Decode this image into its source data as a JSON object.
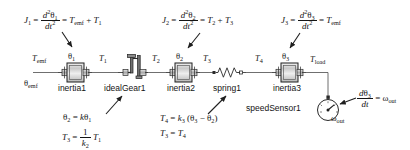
{
  "diagram": {
    "colors": {
      "line": "#3a3a3a",
      "text": "#141414",
      "body_fill": "#d9d9d9",
      "body_stroke": "#1f1f1f",
      "highlight": "#ffffff"
    },
    "equations": [
      {
        "id": "eq-j1",
        "lhs": "J",
        "lhs_sub": "1",
        "num": "d",
        "num_sup": "2",
        "num_var": "θ",
        "num_var_sub": "1",
        "den": "dt",
        "den_sup": "2",
        "rhs": "T",
        "rhs_sub": "emf",
        "rhs2": "T",
        "rhs2_sub": "1",
        "op": "+"
      },
      {
        "id": "eq-j2",
        "lhs": "J",
        "lhs_sub": "2",
        "num": "d",
        "num_sup": "2",
        "num_var": "θ",
        "num_var_sub": "2",
        "den": "dt",
        "den_sup": "2",
        "rhs": "T",
        "rhs_sub": "2",
        "rhs2": "T",
        "rhs2_sub": "3",
        "op": "+"
      },
      {
        "id": "eq-j3",
        "lhs": "J",
        "lhs_sub": "3",
        "num": "d",
        "num_sup": "2",
        "num_var": "θ",
        "num_var_sub": "3",
        "den": "dt",
        "den_sup": "2",
        "rhs": "T",
        "rhs_sub": "emf",
        "rhs2": "",
        "rhs2_sub": "",
        "op": ""
      }
    ],
    "gear_equations": {
      "line1_lhs": "θ",
      "line1_lhs_sub": "2",
      "line1_rhs_k": "k",
      "line1_rhs_var": "θ",
      "line1_rhs_sub": "1",
      "line2_lhs": "T",
      "line2_lhs_sub": "3",
      "line2_num": "1",
      "line2_den": "k",
      "line2_den_sub": "2",
      "line2_rhs": "T",
      "line2_rhs_sub": "1"
    },
    "spring_equations": {
      "line1_lhs": "T",
      "line1_lhs_sub": "4",
      "line1_k": "k",
      "line1_k_sub": "3",
      "line1_a": "θ",
      "line1_a_sub": "3",
      "line1_minus": "−",
      "line1_b": "θ",
      "line1_b_sub": "2",
      "line2_lhs": "T",
      "line2_lhs_sub": "3",
      "line2_rhs": "T",
      "line2_rhs_sub": "4"
    },
    "sensor_equation": {
      "num_d": "d",
      "num_var": "θ",
      "num_var_sub": "3",
      "den": "dt",
      "rhs": "ω",
      "rhs_sub": "out"
    },
    "components": [
      {
        "id": "inertia1",
        "label": "inertia1",
        "type": "inertia"
      },
      {
        "id": "idealGear1",
        "label": "idealGear1",
        "type": "gear"
      },
      {
        "id": "inertia2",
        "label": "inertia2",
        "type": "inertia"
      },
      {
        "id": "spring1",
        "label": "spring1",
        "type": "spring"
      },
      {
        "id": "inertia3",
        "label": "inertia3",
        "type": "inertia"
      },
      {
        "id": "speedSensor1",
        "label": "speedSensor1",
        "type": "sensor"
      }
    ],
    "port_labels": [
      {
        "id": "t-emf",
        "base": "T",
        "sub": "emf"
      },
      {
        "id": "theta-emf",
        "base": "θ",
        "sub": "emf"
      },
      {
        "id": "theta-1",
        "base": "θ",
        "sub": "1"
      },
      {
        "id": "t-1",
        "base": "T",
        "sub": "1"
      },
      {
        "id": "t-2",
        "base": "T",
        "sub": "2"
      },
      {
        "id": "theta-2",
        "base": "θ",
        "sub": "2"
      },
      {
        "id": "t-3",
        "base": "T",
        "sub": "3"
      },
      {
        "id": "t-4",
        "base": "T",
        "sub": "4"
      },
      {
        "id": "theta-3",
        "base": "θ",
        "sub": "3"
      },
      {
        "id": "t-load",
        "base": "T",
        "sub": "load"
      },
      {
        "id": "omega-out",
        "base": "ω",
        "sub": "out"
      }
    ]
  }
}
